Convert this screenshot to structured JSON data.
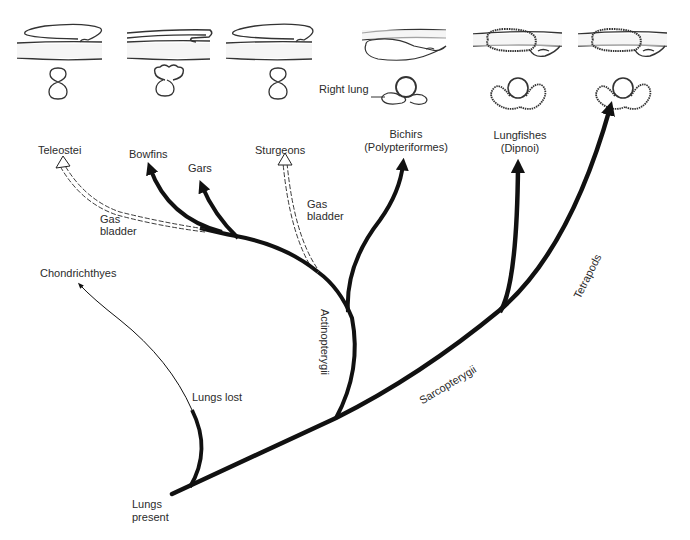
{
  "diagram": {
    "colors": {
      "line": "#111111",
      "text": "#2b2b2b",
      "background": "#ffffff",
      "anatomy_stroke": "#333333"
    },
    "taxa": {
      "teleostei": "Teleostei",
      "bowfins": "Bowfins",
      "gars": "Gars",
      "sturgeons": "Sturgeons",
      "bichirs_line1": "Bichirs",
      "bichirs_line2": "(Polypteriformes)",
      "lungfishes_line1": "Lungfishes",
      "lungfishes_line2": "(Dipnoi)",
      "chondrichthyes": "Chondrichthyes",
      "tetrapods": "Tetrapods"
    },
    "clades": {
      "actinopterygii": "Actinopterygii",
      "sarcopterygii": "Sarcopterygii"
    },
    "annotations": {
      "gas_bladder_left_line1": "Gas",
      "gas_bladder_left_line2": "bladder",
      "gas_bladder_right_line1": "Gas",
      "gas_bladder_right_line2": "bladder",
      "lungs_lost": "Lungs lost",
      "lungs_present_line1": "Lungs",
      "lungs_present_line2": "present",
      "right_lung": "Right lung"
    },
    "branch_styles": {
      "solid_thick": "lung-bearing lineage",
      "dashed_double": "gas bladder lineage",
      "thin": "lungs lost lineage"
    },
    "anatomy_illustrations": [
      {
        "taxon": "Teleostei",
        "type": "gas bladder, dorsal"
      },
      {
        "taxon": "Bowfins",
        "type": "gas bladder, dorsal, lobed"
      },
      {
        "taxon": "Sturgeons",
        "type": "gas bladder, dorsal"
      },
      {
        "taxon": "Bichirs",
        "type": "ventral lungs, right lung larger"
      },
      {
        "taxon": "Lungfishes",
        "type": "ventral paired lungs, alveolated"
      },
      {
        "taxon": "Tetrapods",
        "type": "ventral paired lungs, alveolated"
      }
    ]
  }
}
